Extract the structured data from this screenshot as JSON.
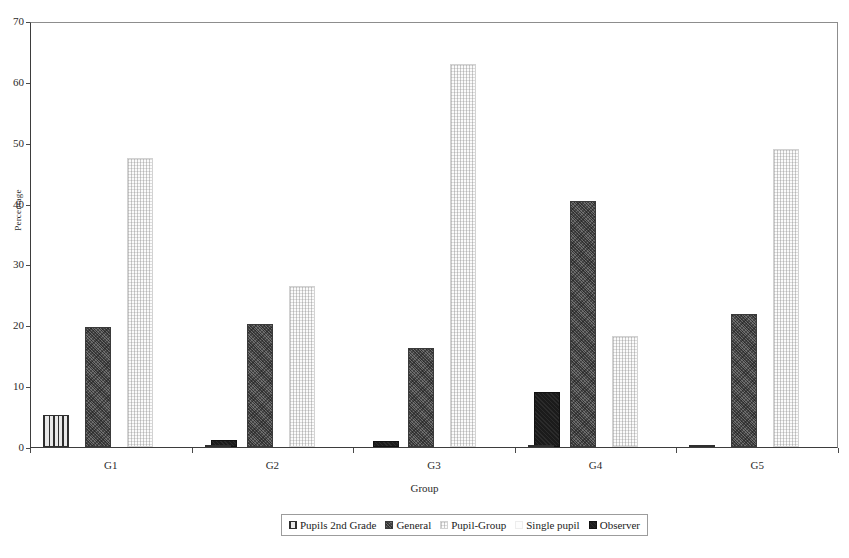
{
  "chart_data": {
    "type": "bar",
    "title": "",
    "xlabel": "Group",
    "ylabel": "Percentage",
    "categories": [
      "G1",
      "G2",
      "G3",
      "G4",
      "G5"
    ],
    "ylim": [
      0,
      70
    ],
    "yticks": [
      0,
      10,
      20,
      30,
      40,
      50,
      60,
      70
    ],
    "grid": false,
    "legend_position": "bottom",
    "series": [
      {
        "name": "Pupils 2nd Grade",
        "pattern": "vertical-stripes",
        "color": "#e6e6e6",
        "values": [
          5.3,
          0.4,
          0.0,
          0.4,
          0.4
        ]
      },
      {
        "name": "General",
        "pattern": "dark-speckle",
        "color": "#6e6e6e",
        "values": [
          19.8,
          20.2,
          16.3,
          40.5,
          21.9
        ]
      },
      {
        "name": "Pupil-Group",
        "pattern": "light-stipple",
        "color": "#fbfbfb",
        "values": [
          47.5,
          26.5,
          63.0,
          18.3,
          49.0
        ]
      },
      {
        "name": "Single pupil",
        "pattern": "near-white",
        "color": "#fdfdfd",
        "values": [
          0.0,
          0.0,
          0.0,
          0.0,
          0.0
        ]
      },
      {
        "name": "Observer",
        "pattern": "solid-black",
        "color": "#1b1b1b",
        "values": [
          1.2,
          1.0,
          9.1,
          0.0,
          2.2
        ]
      }
    ]
  },
  "axes": {
    "y_title": "Percentage",
    "x_title": "Group",
    "y_tick_labels": [
      "0",
      "10",
      "20",
      "30",
      "40",
      "50",
      "60",
      "70"
    ],
    "x_tick_labels": [
      "G1",
      "G2",
      "G3",
      "G4",
      "G5"
    ]
  },
  "legend": {
    "entries": [
      {
        "label": "Pupils 2nd Grade",
        "swatch": "vertical-stripes"
      },
      {
        "label": "General",
        "swatch": "dark-speckle"
      },
      {
        "label": "Pupil-Group",
        "swatch": "light-stipple"
      },
      {
        "label": "Single pupil",
        "swatch": "near-white"
      },
      {
        "label": "Observer",
        "swatch": "solid-black"
      }
    ]
  }
}
